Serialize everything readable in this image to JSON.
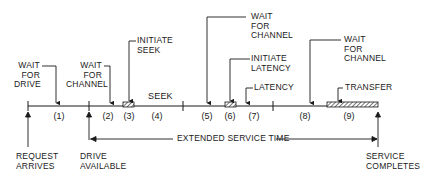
{
  "diagram": {
    "colors": {
      "ink": "#1a1a1a",
      "background": "#ffffff"
    },
    "timeline": {
      "segments": [
        {
          "id": "1",
          "label": "(1)"
        },
        {
          "id": "2",
          "label": "(2)"
        },
        {
          "id": "3",
          "label": "(3)"
        },
        {
          "id": "4",
          "label": "(4)"
        },
        {
          "id": "5",
          "label": "(5)"
        },
        {
          "id": "6",
          "label": "(6)"
        },
        {
          "id": "7",
          "label": "(7)"
        },
        {
          "id": "8",
          "label": "(8)"
        },
        {
          "id": "9",
          "label": "(9)"
        }
      ],
      "inline_labels": {
        "seek": "SEEK"
      }
    },
    "callouts": {
      "wait_for_drive": "WAIT\nFOR\nDRIVE",
      "wait_for_channel_1": "WAIT\nFOR\nCHANNEL",
      "initiate_seek": "INITIATE\nSEEK",
      "wait_for_channel_2": "WAIT\nFOR\nCHANNEL",
      "initiate_latency": "INITIATE\nLATENCY",
      "latency": "LATENCY",
      "wait_for_channel_3": "WAIT\nFOR\nCHANNEL",
      "transfer": "TRANSFER"
    },
    "events": {
      "request_arrives": "REQUEST\nARRIVES",
      "drive_available": "DRIVE\nAVAILABLE",
      "service_completes": "SERVICE\nCOMPLETES"
    },
    "span": {
      "extended_service_time": "EXTENDED SERVICE TIME"
    }
  }
}
